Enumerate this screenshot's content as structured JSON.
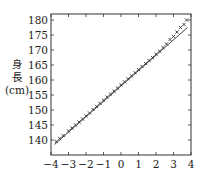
{
  "chart_data": {
    "type": "scatter",
    "title": "",
    "xlabel": "",
    "ylabel_lines": [
      "身",
      "長",
      "(cm)"
    ],
    "xlim": [
      -4,
      4
    ],
    "ylim": [
      135,
      182
    ],
    "xticks": [
      -4,
      -3,
      -2,
      -1,
      0,
      1,
      2,
      3,
      4
    ],
    "xtick_labels": [
      "−4",
      "−3",
      "−2",
      "−1",
      "0",
      "1",
      "2",
      "3",
      "4"
    ],
    "yticks": [
      140,
      145,
      150,
      155,
      160,
      165,
      170,
      175,
      180
    ],
    "ytick_labels": [
      "140",
      "145",
      "150",
      "155",
      "160",
      "165",
      "170",
      "175",
      "180"
    ],
    "grid": false,
    "marker": "x",
    "reference_line": {
      "x": [
        -3.8,
        3.8
      ],
      "y": [
        138.5,
        177.5
      ]
    },
    "series": [
      {
        "name": "身長",
        "x": [
          -3.7,
          -3.5,
          -3.3,
          -3.0,
          -2.8,
          -2.6,
          -2.4,
          -2.2,
          -2.0,
          -1.8,
          -1.6,
          -1.4,
          -1.2,
          -1.0,
          -0.8,
          -0.6,
          -0.4,
          -0.2,
          0.0,
          0.2,
          0.4,
          0.6,
          0.8,
          1.0,
          1.2,
          1.4,
          1.6,
          1.8,
          2.0,
          2.2,
          2.4,
          2.6,
          2.8,
          3.0,
          3.2,
          3.4,
          3.6,
          3.75
        ],
        "y": [
          139.5,
          140.5,
          141.5,
          143.0,
          144.0,
          145.0,
          146.0,
          147.0,
          148.0,
          149.0,
          150.2,
          151.2,
          152.2,
          153.3,
          154.3,
          155.3,
          156.3,
          157.3,
          158.4,
          159.4,
          160.4,
          161.4,
          162.4,
          163.5,
          164.5,
          165.5,
          166.5,
          167.5,
          168.6,
          169.6,
          170.8,
          172.0,
          173.5,
          174.5,
          176.0,
          177.5,
          178.5,
          180.0
        ]
      }
    ]
  }
}
